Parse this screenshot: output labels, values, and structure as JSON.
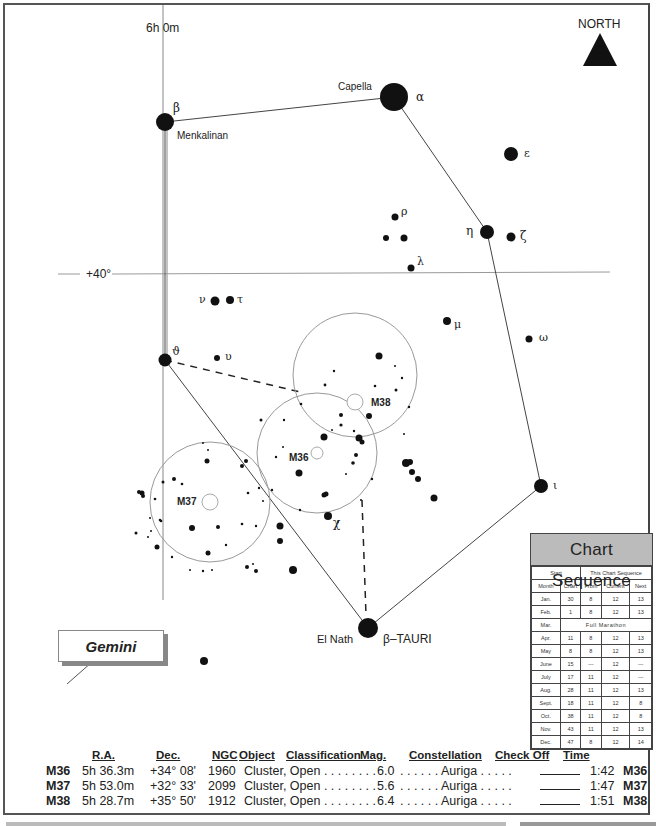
{
  "compass": {
    "label": "NORTH",
    "icon": "north-arrow-icon"
  },
  "grid": {
    "ra_label": "6h  0m",
    "dec_label": "+40°"
  },
  "stars": {
    "capella": {
      "name": "Capella",
      "greek": "α"
    },
    "menkalinan": {
      "name": "Menkalinan",
      "greek": "β"
    },
    "epsilon": {
      "greek": "ε"
    },
    "eta": {
      "greek": "η"
    },
    "zeta": {
      "greek": "ζ"
    },
    "rho": {
      "greek": "ρ"
    },
    "lambda": {
      "greek": "λ"
    },
    "nu": {
      "greek": "ν"
    },
    "tau": {
      "greek": "τ"
    },
    "mu": {
      "greek": "μ"
    },
    "omega": {
      "greek": "ω"
    },
    "theta": {
      "greek": "ϑ"
    },
    "upsilon": {
      "greek": "υ"
    },
    "chi": {
      "greek": "χ"
    },
    "iota": {
      "greek": "ι"
    },
    "elnath": {
      "name": "El Nath",
      "greek": "β–TAURI"
    }
  },
  "clusters": {
    "m36": "M36",
    "m37": "M37",
    "m38": "M38"
  },
  "neighbor_constellation": "Gemini",
  "sequence": {
    "title": "Chart Sequence",
    "group_headers": [
      "Start",
      "This Chart Sequence"
    ],
    "columns": [
      "Month",
      "Chart",
      "From",
      "Current",
      "Next"
    ],
    "rows": [
      [
        "Jan.",
        "30",
        "8",
        "12",
        "13"
      ],
      [
        "Feb.",
        "1",
        "8",
        "12",
        "13"
      ],
      [
        "Mar.",
        "Full Marathon"
      ],
      [
        "Apr.",
        "11",
        "8",
        "12",
        "13"
      ],
      [
        "May",
        "8",
        "8",
        "12",
        "13"
      ],
      [
        "June",
        "15",
        "---",
        "12",
        "---"
      ],
      [
        "July",
        "17",
        "11",
        "12",
        "---"
      ],
      [
        "Aug.",
        "28",
        "11",
        "12",
        "13"
      ],
      [
        "Sept.",
        "18",
        "11",
        "12",
        "8"
      ],
      [
        "Oct.",
        "38",
        "11",
        "12",
        "8"
      ],
      [
        "Nov.",
        "43",
        "11",
        "12",
        "13"
      ],
      [
        "Dec.",
        "47",
        "8",
        "12",
        "14"
      ]
    ]
  },
  "objects": {
    "headers": {
      "ra": "R.A.",
      "dec": "Dec.",
      "ngc": "NGC",
      "object": "Object",
      "classification": "Classification",
      "mag": "Mag.",
      "constellation": "Constellation",
      "check": "Check Off",
      "time": "Time"
    },
    "rows": [
      {
        "id": "M36",
        "ra": "5h 36.3m",
        "dec": "+34° 08'",
        "ngc": "1960",
        "class": "Cluster, Open . . . . . . . .",
        "mag": "6.0",
        "const": ". . . . . . Auriga . . . . .",
        "time": "1:42",
        "tag": "M36"
      },
      {
        "id": "M37",
        "ra": "5h 53.0m",
        "dec": "+32° 33'",
        "ngc": "2099",
        "class": "Cluster, Open . . . . . . . .",
        "mag": "5.6",
        "const": ". . . . . . Auriga . . . . .",
        "time": "1:47",
        "tag": "M37"
      },
      {
        "id": "M38",
        "ra": "5h 28.7m",
        "dec": "+35° 50'",
        "ngc": "1912",
        "class": "Cluster, Open . . . . . . . .",
        "mag": "6.4",
        "const": ". . . . . . Auriga . . . . .",
        "time": "1:51",
        "tag": "M38"
      }
    ]
  }
}
